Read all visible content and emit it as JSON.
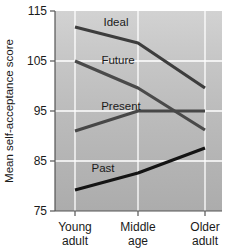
{
  "chart_data": {
    "type": "line",
    "title": "",
    "xlabel": "",
    "ylabel": "Mean self-acceptance score",
    "categories": [
      "Young adult",
      "Middle age",
      "Older adult"
    ],
    "category_lines": [
      [
        "Young",
        "adult"
      ],
      [
        "Middle",
        "age"
      ],
      [
        "Older",
        "adult"
      ]
    ],
    "ylim": [
      75,
      115
    ],
    "yticks": [
      75,
      85,
      95,
      105,
      115
    ],
    "ytick_labels": [
      "75",
      "85",
      "95",
      "105",
      "115"
    ],
    "grid": "horizontal-and-vertical-white",
    "legend": "inline-labels",
    "series": [
      {
        "name": "Ideal",
        "values": [
          111.8,
          108.6,
          99.6
        ],
        "color": "#3d3d3d",
        "width": 3.2
      },
      {
        "name": "Future",
        "values": [
          105.0,
          99.6,
          91.2
        ],
        "color": "#4a4a4a",
        "width": 3.2
      },
      {
        "name": "Present",
        "values": [
          91.0,
          95.0,
          95.0
        ],
        "color": "#474747",
        "width": 3.2
      },
      {
        "name": "Past",
        "values": [
          79.2,
          82.6,
          87.6
        ],
        "color": "#141414",
        "width": 3.2
      }
    ],
    "series_label_positions": [
      {
        "name": "Ideal",
        "x": 116,
        "y": 26
      },
      {
        "name": "Future",
        "x": 118,
        "y": 64
      },
      {
        "name": "Present",
        "x": 118,
        "y": 110
      },
      {
        "name": "Past",
        "x": 103,
        "y": 172
      }
    ]
  },
  "plot": {
    "background_top": "#cfcfcf",
    "background_bottom": "#b0b0b0",
    "axis_color": "#555555",
    "grid_color": "#ffffff"
  }
}
